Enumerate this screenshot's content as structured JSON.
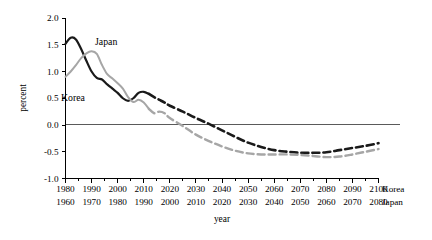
{
  "chart_data": {
    "type": "line",
    "title": "",
    "xlabel": "year",
    "ylabel": "percent",
    "ylim": [
      -1.0,
      2.0
    ],
    "y_ticks": [
      "2.0",
      "1.5",
      "1.0",
      "0.5",
      "0.0",
      "-0.5",
      "-1.0"
    ],
    "y_tick_values": [
      2.0,
      1.5,
      1.0,
      0.5,
      0.0,
      -0.5,
      -1.0
    ],
    "grid": false,
    "legend": "inline-annotations",
    "zero_reference_line": true,
    "x_axis_rows": [
      {
        "tag": "Korea",
        "ticks": [
          "1980",
          "1990",
          "2000",
          "2010",
          "2020",
          "2030",
          "2040",
          "2050",
          "2060",
          "2070",
          "2080",
          "2090",
          "2100"
        ],
        "tick_values": [
          1980,
          1990,
          2000,
          2010,
          2020,
          2030,
          2040,
          2050,
          2060,
          2070,
          2080,
          2090,
          2100
        ]
      },
      {
        "tag": "Japan",
        "ticks": [
          "1960",
          "1970",
          "1980",
          "1990",
          "2000",
          "2010",
          "2020",
          "2030",
          "2040",
          "2050",
          "2060",
          "2070",
          "2080"
        ],
        "tick_values": [
          1960,
          1970,
          1980,
          1990,
          2000,
          2010,
          2020,
          2030,
          2040,
          2050,
          2060,
          2070,
          2080
        ]
      }
    ],
    "xlim": [
      1980,
      2100
    ],
    "series": [
      {
        "name": "Korea",
        "label": "Korea",
        "color": "#1a1a1a",
        "solid_width": 2.2,
        "dashed_width": 2.6,
        "dash_pattern": "7,4",
        "split_x": 2012,
        "x": [
          1980,
          1982,
          1984,
          1986,
          1988,
          1990,
          1992,
          1994,
          1996,
          1998,
          2000,
          2002,
          2004,
          2006,
          2008,
          2010,
          2012,
          2014,
          2016,
          2018,
          2020,
          2025,
          2030,
          2035,
          2040,
          2045,
          2050,
          2055,
          2060,
          2065,
          2070,
          2075,
          2080,
          2085,
          2090,
          2095,
          2100
        ],
        "values": [
          1.52,
          1.63,
          1.6,
          1.42,
          1.2,
          1.0,
          0.88,
          0.85,
          0.76,
          0.68,
          0.6,
          0.5,
          0.45,
          0.5,
          0.6,
          0.62,
          0.58,
          0.52,
          0.47,
          0.42,
          0.36,
          0.25,
          0.13,
          0.02,
          -0.1,
          -0.22,
          -0.33,
          -0.41,
          -0.47,
          -0.5,
          -0.52,
          -0.52,
          -0.51,
          -0.47,
          -0.43,
          -0.39,
          -0.34
        ]
      },
      {
        "name": "Japan",
        "label": "Japan",
        "color": "#a6a6a6",
        "solid_width": 2.0,
        "dashed_width": 2.4,
        "dash_pattern": "7,4",
        "split_x": 2012,
        "x": [
          1980,
          1982,
          1984,
          1986,
          1988,
          1990,
          1992,
          1994,
          1996,
          1998,
          2000,
          2002,
          2004,
          2006,
          2008,
          2010,
          2012,
          2014,
          2016,
          2018,
          2020,
          2025,
          2030,
          2035,
          2040,
          2045,
          2050,
          2055,
          2060,
          2065,
          2070,
          2075,
          2080,
          2085,
          2090,
          2095,
          2100
        ],
        "values": [
          0.9,
          1.0,
          1.12,
          1.25,
          1.34,
          1.38,
          1.33,
          1.12,
          0.95,
          0.87,
          0.78,
          0.68,
          0.52,
          0.43,
          0.47,
          0.42,
          0.3,
          0.22,
          0.25,
          0.22,
          0.13,
          -0.02,
          -0.18,
          -0.3,
          -0.4,
          -0.48,
          -0.53,
          -0.55,
          -0.55,
          -0.55,
          -0.56,
          -0.58,
          -0.6,
          -0.59,
          -0.55,
          -0.5,
          -0.45
        ]
      }
    ],
    "annotations": [
      {
        "text": "Japan",
        "x_px": 95,
        "y_px": 45
      },
      {
        "text": "Korea",
        "x_px": 61,
        "y_px": 101
      }
    ]
  }
}
